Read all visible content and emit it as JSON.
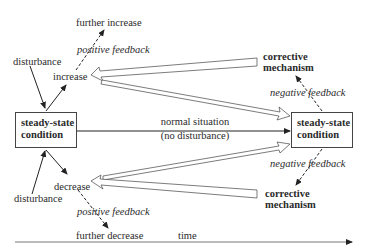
{
  "diagram": {
    "left_box": {
      "line1": "steady-state",
      "line2": "condition"
    },
    "right_box": {
      "line1": "steady-state",
      "line2": "condition"
    },
    "top": {
      "further": "further increase",
      "feedback": "positive feedback",
      "disturbance": "disturbance",
      "change": "increase",
      "corrective1": "corrective",
      "corrective2": "mechanism",
      "negative": "negative feedback"
    },
    "bottom": {
      "further": "further decrease",
      "feedback": "positive feedback",
      "disturbance": "disturbance",
      "change": "decrease",
      "corrective1": "corrective",
      "corrective2": "mechanism",
      "negative": "negative feedback"
    },
    "middle": {
      "line1": "normal situation",
      "line2": "(no disturbance)"
    },
    "axis": {
      "label": "time"
    }
  }
}
